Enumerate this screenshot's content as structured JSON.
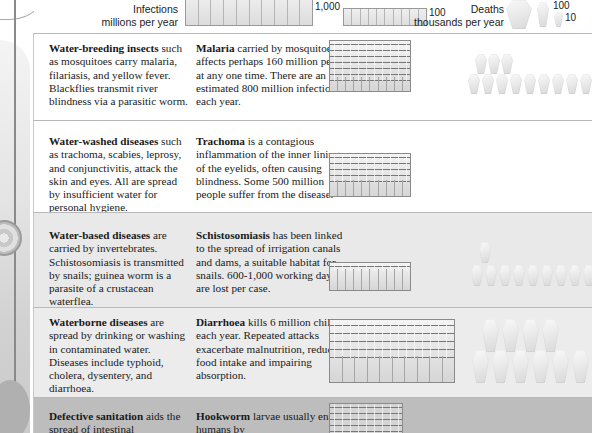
{
  "legend": {
    "infections_label": "Infections",
    "infections_unit": "millions per year",
    "infections_big_value": "1,000",
    "infections_small_value": "100",
    "deaths_label": "Deaths",
    "deaths_unit": "thousands per year",
    "deaths_big_value": "100",
    "deaths_small_value": "10"
  },
  "rows": [
    {
      "category_bold": "Water-breeding insects",
      "category_text": " such as mosquitoes carry malaria, filariasis, and yellow fever. Blackflies transmit river blindness via a parasitic worm.",
      "disease_bold": "Malaria",
      "disease_text": " carried by mosquitoes, affects perhaps 160 million people at any one time. There are an estimated 800 million infections each year.",
      "infections_millions": 800,
      "deaths_thousands": 1200
    },
    {
      "category_bold": "Water-washed diseases",
      "category_text": " such as trachoma, scabies, leprosy, and conjunctivitis, attack the skin and eyes. All are spread by insufficient water for personal hygiene.",
      "disease_bold": "Trachoma",
      "disease_text": " is a contagious inflammation of the inner lining of the eyelids, often causing blindness. Some 500 million people suffer from the disease.",
      "infections_millions": 500,
      "deaths_thousands": 0
    },
    {
      "category_bold": "Water-based diseases",
      "category_text": " are carried by invertebrates. Schistosomiasis is transmitted by snails; guinea worm is a parasite of a crustacean waterflea.",
      "disease_bold": "Schistosomiasis",
      "disease_text": " has been linked to the spread of irrigation canals and dams, a suitable habitat for snails. 600-1,000 working days are lost per case.",
      "infections_millions": 200,
      "deaths_thousands": 1000
    },
    {
      "category_bold": "Waterborne diseases",
      "category_text": " are spread by drinking or washing in contaminated water. Diseases include typhoid, cholera, dysentery, and diarrhoea.",
      "disease_bold": "Diarrhoea",
      "disease_text": " kills 6 million children each year. Repeated attacks exacerbate malnutrition, reducing food intake and impairing absorption.",
      "infections_millions": 1000,
      "deaths_thousands": 6000
    },
    {
      "category_bold": "Defective sanitation",
      "category_text": " aids the spread of intestinal",
      "disease_bold": "Hookworm",
      "disease_text": " larvae usually enter humans by",
      "infections_millions": 800,
      "deaths_thousands": 0
    }
  ]
}
